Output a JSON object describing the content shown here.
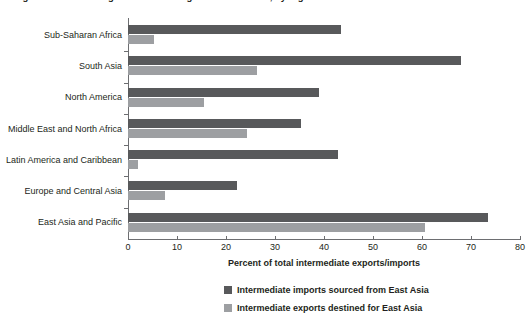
{
  "figure": {
    "caption_clipped": "Figure: Intermediate goods trade linkages with East Asia, by region",
    "axis_title": "Percent of total intermediate exports/imports"
  },
  "legend": {
    "position": "bottom",
    "items": [
      {
        "label": "Intermediate imports sourced from East Asia",
        "color": "#58595b",
        "swatch": "dark-gray-square"
      },
      {
        "label": "Intermediate exports destined for East Asia",
        "color": "#9d9fa2",
        "swatch": "light-gray-square"
      }
    ]
  },
  "chart_data": {
    "type": "bar",
    "orientation": "horizontal",
    "title": "",
    "subtitle": "",
    "xlabel": "Percent of total intermediate exports/imports",
    "ylabel": "",
    "xlim": [
      0,
      80
    ],
    "xticks": [
      0,
      10,
      20,
      30,
      40,
      50,
      60,
      70,
      80
    ],
    "xtick_labels": [
      "0",
      "10",
      "20",
      "30",
      "40",
      "50",
      "60",
      "70",
      "80"
    ],
    "grid": false,
    "categories": [
      "Sub-Saharan Africa",
      "South Asia",
      "North America",
      "Middle East and North Africa",
      "Latin America and Caribbean",
      "Europe and Central Asia",
      "East Asia and Pacific"
    ],
    "series": [
      {
        "name": "Intermediate imports sourced from East Asia",
        "color": "#58595b",
        "values": [
          43.5,
          68.0,
          39.0,
          35.3,
          42.9,
          22.3,
          73.5
        ]
      },
      {
        "name": "Intermediate exports destined for East Asia",
        "color": "#9d9fa2",
        "values": [
          5.3,
          26.3,
          15.5,
          24.3,
          2.0,
          7.5,
          60.6
        ]
      }
    ]
  }
}
